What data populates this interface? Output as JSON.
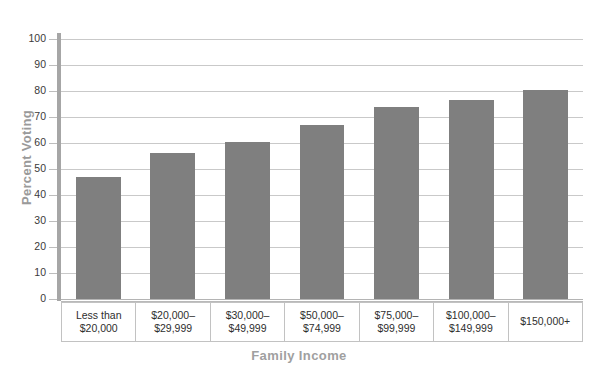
{
  "chart_data": {
    "type": "bar",
    "title": "",
    "xlabel": "Family Income",
    "ylabel": "Percent Voting",
    "categories": [
      "Less than\n$20,000",
      "$20,000–\n$29,999",
      "$30,000–\n$49,999",
      "$50,000–\n$74,999",
      "$75,000–\n$99,999",
      "$100,000–\n$149,999",
      "$150,000+"
    ],
    "category_lines": [
      [
        "Less than",
        "$20,000"
      ],
      [
        "$20,000–",
        "$29,999"
      ],
      [
        "$30,000–",
        "$49,999"
      ],
      [
        "$50,000–",
        "$74,999"
      ],
      [
        "$75,000–",
        "$99,999"
      ],
      [
        "$100,000–",
        "$149,999"
      ],
      [
        "$150,000+",
        ""
      ]
    ],
    "values": [
      47,
      56,
      60.5,
      67,
      74,
      76.5,
      80.5
    ],
    "ylim": [
      0,
      100
    ],
    "ytick_values": [
      0,
      10,
      20,
      30,
      40,
      50,
      60,
      70,
      80,
      90,
      100
    ],
    "ytick_labels": [
      "0",
      "10",
      "20",
      "30",
      "40",
      "50",
      "60",
      "70",
      "80",
      "90",
      "100"
    ],
    "grid": true,
    "legend": false,
    "bar_color": "#7f7f7f",
    "gridline_color": "#c9c9c9",
    "axis_label_color": "#9a9a9a"
  },
  "axis": {
    "y_title": "Percent Voting",
    "x_title": "Family Income"
  },
  "title_strip": {
    "text": ""
  }
}
